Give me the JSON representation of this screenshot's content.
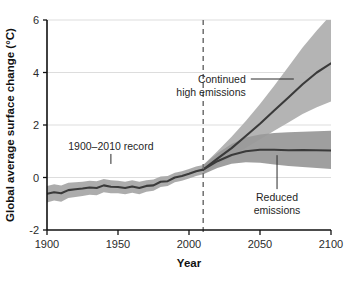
{
  "chart_data": {
    "type": "line",
    "title": "",
    "xlabel": "Year",
    "ylabel": "Global average surface change (°C)",
    "xlim": [
      1900,
      2100
    ],
    "ylim": [
      -2,
      6
    ],
    "xticks": [
      "1900",
      "1950",
      "2000",
      "2050",
      "2100"
    ],
    "xtick_values": [
      1900,
      1950,
      2000,
      2050,
      2100
    ],
    "yticks": [
      "6",
      "4",
      "2",
      "0",
      "-2"
    ],
    "ytick_values": [
      6,
      4,
      2,
      0,
      -2
    ],
    "grid": "horizontal",
    "legend_position": "inline-annotations",
    "annotations": [
      {
        "name": "historical-record",
        "text": "1900–2010 record",
        "x": 1945,
        "y": 1.05
      },
      {
        "name": "high-emissions",
        "text_line1": "Continued",
        "text_line2": "high emissions",
        "x": 2040,
        "y": 3.6
      },
      {
        "name": "reduced-emissions",
        "text_line1": "Reduced",
        "text_line2": "emissions",
        "x": 2062,
        "y": -0.9
      }
    ],
    "divider": {
      "name": "projection-start",
      "x": 2010,
      "style": "dashed"
    },
    "series": [
      {
        "name": "1900-2010 record",
        "x": [
          1900,
          1905,
          1910,
          1915,
          1920,
          1925,
          1930,
          1935,
          1940,
          1945,
          1950,
          1955,
          1960,
          1965,
          1970,
          1975,
          1980,
          1985,
          1990,
          1995,
          2000,
          2005,
          2010
        ],
        "values": [
          -0.62,
          -0.56,
          -0.6,
          -0.48,
          -0.45,
          -0.42,
          -0.38,
          -0.4,
          -0.3,
          -0.35,
          -0.36,
          -0.4,
          -0.34,
          -0.4,
          -0.32,
          -0.3,
          -0.16,
          -0.14,
          0.0,
          0.06,
          0.14,
          0.24,
          0.3
        ],
        "band_low": [
          -0.95,
          -0.88,
          -0.92,
          -0.78,
          -0.74,
          -0.7,
          -0.66,
          -0.68,
          -0.56,
          -0.6,
          -0.6,
          -0.64,
          -0.58,
          -0.64,
          -0.54,
          -0.5,
          -0.36,
          -0.32,
          -0.18,
          -0.12,
          -0.04,
          0.06,
          0.12
        ],
        "band_high": [
          -0.32,
          -0.26,
          -0.3,
          -0.2,
          -0.18,
          -0.16,
          -0.12,
          -0.14,
          -0.06,
          -0.1,
          -0.12,
          -0.16,
          -0.1,
          -0.16,
          -0.1,
          -0.08,
          0.04,
          0.06,
          0.18,
          0.24,
          0.32,
          0.42,
          0.48
        ]
      },
      {
        "name": "Continued high emissions",
        "x": [
          2010,
          2020,
          2030,
          2040,
          2050,
          2060,
          2070,
          2080,
          2090,
          2100
        ],
        "values": [
          0.3,
          0.72,
          1.12,
          1.58,
          2.05,
          2.55,
          3.05,
          3.55,
          4.0,
          4.35
        ],
        "band_low": [
          0.12,
          0.48,
          0.8,
          1.12,
          1.45,
          1.78,
          2.1,
          2.42,
          2.68,
          2.9
        ],
        "band_high": [
          0.48,
          1.0,
          1.55,
          2.15,
          2.8,
          3.5,
          4.22,
          4.95,
          5.6,
          6.2
        ]
      },
      {
        "name": "Reduced emissions",
        "x": [
          2010,
          2020,
          2030,
          2040,
          2050,
          2060,
          2070,
          2080,
          2090,
          2100
        ],
        "values": [
          0.3,
          0.62,
          0.86,
          1.0,
          1.06,
          1.06,
          1.04,
          1.05,
          1.04,
          1.03
        ],
        "band_low": [
          0.12,
          0.36,
          0.52,
          0.58,
          0.56,
          0.5,
          0.44,
          0.4,
          0.36,
          0.32
        ],
        "band_high": [
          0.48,
          0.92,
          1.28,
          1.52,
          1.64,
          1.7,
          1.72,
          1.74,
          1.76,
          1.78
        ]
      }
    ]
  },
  "axis": {
    "x_label": "Year",
    "y_label": "Global average surface change (°C)"
  },
  "colors": {
    "band_high": "#b0b0b0",
    "band_low": "#9a9a9a",
    "line": "#3a3a3a",
    "grid": "#d9d9d9",
    "axis": "#111111",
    "divider": "#6f6f6f",
    "background": "#ffffff"
  }
}
